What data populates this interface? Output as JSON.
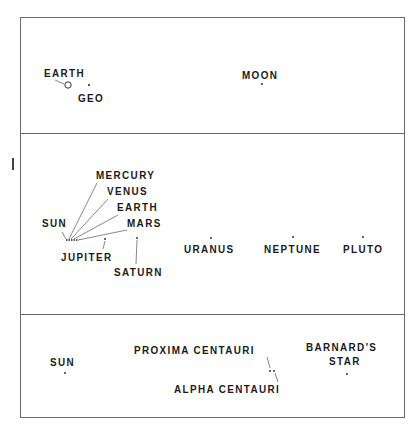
{
  "diagram": {
    "type": "scale-comparison",
    "panels": [
      {
        "id": "earth-moon",
        "bodies": [
          {
            "name": "EARTH",
            "marker": "circle"
          },
          {
            "name": "GEO",
            "marker": "dot"
          },
          {
            "name": "MOON",
            "marker": "dot"
          }
        ]
      },
      {
        "id": "solar-system",
        "bodies": [
          {
            "name": "SUN",
            "marker": "dot"
          },
          {
            "name": "MERCURY",
            "marker": "dot"
          },
          {
            "name": "VENUS",
            "marker": "dot"
          },
          {
            "name": "EARTH",
            "marker": "dot"
          },
          {
            "name": "MARS",
            "marker": "dot"
          },
          {
            "name": "JUPITER",
            "marker": "dot"
          },
          {
            "name": "SATURN",
            "marker": "dot"
          },
          {
            "name": "URANUS",
            "marker": "dot"
          },
          {
            "name": "NEPTUNE",
            "marker": "dot"
          },
          {
            "name": "PLUTO",
            "marker": "dot"
          }
        ]
      },
      {
        "id": "nearby-stars",
        "bodies": [
          {
            "name": "SUN",
            "marker": "dot"
          },
          {
            "name": "PROXIMA CENTAURI",
            "marker": "dot"
          },
          {
            "name": "ALPHA CENTAURI",
            "marker": "dot"
          },
          {
            "name": "BARNARD'S STAR",
            "marker": "dot"
          }
        ]
      }
    ]
  },
  "labels": {
    "p1": {
      "earth": "EARTH",
      "geo": "GEO",
      "moon": "MOON"
    },
    "p2": {
      "sun": "SUN",
      "mercury": "MERCURY",
      "venus": "VENUS",
      "earth": "EARTH",
      "mars": "MARS",
      "jupiter": "JUPITER",
      "saturn": "SATURN",
      "uranus": "URANUS",
      "neptune": "NEPTUNE",
      "pluto": "PLUTO"
    },
    "p3": {
      "sun": "SUN",
      "proxima": "PROXIMA CENTAURI",
      "alpha": "ALPHA CENTAURI",
      "barnard_line1": "BARNARD'S",
      "barnard_line2": "STAR"
    }
  },
  "colors": {
    "ink": "#1a1a1a",
    "frame": "#6a6a6a",
    "leader": "#555555",
    "background": "#ffffff"
  }
}
